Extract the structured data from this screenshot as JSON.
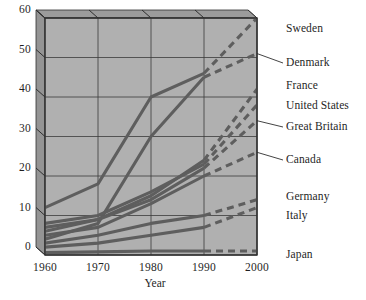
{
  "chart_data": {
    "type": "line",
    "title": "",
    "xlabel": "Year",
    "ylabel": "",
    "x": [
      1960,
      1970,
      1980,
      1990,
      2000
    ],
    "xlim": [
      1960,
      2000
    ],
    "ylim": [
      0,
      60
    ],
    "xticks": [
      "1960",
      "1970",
      "1980",
      "1990",
      "2000"
    ],
    "yticks": [
      "0",
      "10",
      "20",
      "30",
      "40",
      "50",
      "60"
    ],
    "grid": true,
    "legend_position": "right-of-axes",
    "projection_note": "segments after 1990 are drawn dashed (projected)",
    "series": [
      {
        "name": "Sweden",
        "values": [
          12,
          18,
          40,
          46,
          60
        ],
        "solid_through": 1990
      },
      {
        "name": "Denmark",
        "values": [
          4,
          8,
          30,
          45,
          51
        ],
        "solid_through": 1990
      },
      {
        "name": "France",
        "values": [
          7,
          9,
          15,
          24,
          42
        ],
        "solid_through": 1990
      },
      {
        "name": "United States",
        "values": [
          8,
          10,
          16,
          23,
          38
        ],
        "solid_through": 1990
      },
      {
        "name": "Great Britain",
        "values": [
          6,
          9,
          14,
          22,
          34
        ],
        "solid_through": 1990
      },
      {
        "name": "Canada",
        "values": [
          5,
          7,
          13,
          20,
          26
        ],
        "solid_through": 1990
      },
      {
        "name": "Germany",
        "values": [
          3,
          5,
          8,
          10,
          14
        ],
        "solid_through": 1990
      },
      {
        "name": "Italy",
        "values": [
          2,
          3,
          5,
          7,
          12
        ],
        "solid_through": 1990
      },
      {
        "name": "Japan",
        "values": [
          0.6,
          0.8,
          1,
          1,
          1
        ],
        "solid_through": 1990
      }
    ]
  },
  "legend": {
    "items": [
      {
        "label": "Sweden",
        "connector": false
      },
      {
        "label": "Denmark",
        "connector": true
      },
      {
        "label": "France",
        "connector": false
      },
      {
        "label": "United States",
        "connector": false
      },
      {
        "label": "Great Britain",
        "connector": true
      },
      {
        "label": "Canada",
        "connector": true
      },
      {
        "label": "Germany",
        "connector": false
      },
      {
        "label": "Italy",
        "connector": false
      },
      {
        "label": "Japan",
        "connector": false
      }
    ]
  },
  "colors": {
    "plot_background": "#b0b0b0",
    "panel_bevel": "#949494",
    "line": "#5e5e5e",
    "grid": "#3a3a3a",
    "text": "#1f1f1f",
    "page_background": "#ffffff"
  }
}
